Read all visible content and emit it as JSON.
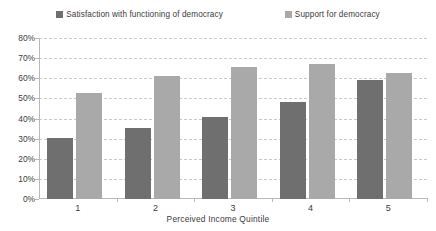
{
  "chart_data": {
    "type": "bar",
    "title": "",
    "xlabel": "Perceived Income Quintile",
    "ylabel": "",
    "categories": [
      "1",
      "2",
      "3",
      "4",
      "5"
    ],
    "ylim": [
      0,
      80
    ],
    "ytick_labels": [
      "0%",
      "10%",
      "20%",
      "30%",
      "40%",
      "50%",
      "60%",
      "70%",
      "80%"
    ],
    "ytick_values": [
      0,
      10,
      20,
      30,
      40,
      50,
      60,
      70,
      80
    ],
    "grid": true,
    "legend_position": "top",
    "series": [
      {
        "name": "Satisfaction with  functioning of democracy",
        "color": "#6f6f6f",
        "values": [
          30.5,
          35.5,
          41,
          48,
          59
        ]
      },
      {
        "name": "Support for democracy",
        "color": "#a9a9a9",
        "values": [
          52.5,
          61,
          65.5,
          67,
          62.5
        ]
      }
    ]
  },
  "legend": {
    "entries": [
      {
        "label": "Satisfaction with  functioning of democracy"
      },
      {
        "label": "Support for democracy"
      }
    ]
  },
  "axes": {
    "x_title": "Perceived Income Quintile"
  },
  "colors": {
    "series_satisfaction": "#6f6f6f",
    "series_support": "#a9a9a9",
    "axis": "#b9b9b9",
    "gridline": "#c9c9c9",
    "text": "#3b3b3b",
    "background": "#ffffff"
  }
}
